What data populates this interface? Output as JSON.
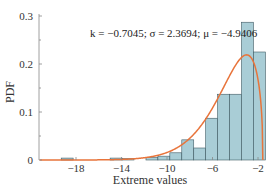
{
  "chart_data": {
    "type": "bar",
    "subtype": "histogram_with_fitted_pdf",
    "title": "",
    "annotation": "k = −0.7045;  σ = 2.3694;  μ = −4.9406",
    "params": {
      "k": -0.7045,
      "sigma": 2.3694,
      "mu": -4.9406
    },
    "xlabel": "Extreme values",
    "ylabel": "PDF",
    "xlim": [
      -21.2,
      -0.9
    ],
    "ylim": [
      0,
      0.3
    ],
    "xticks": [
      -18,
      -14,
      -10,
      -6,
      -2
    ],
    "xtick_labels": [
      "−18",
      "−14",
      "−10",
      "−6",
      "−2"
    ],
    "yticks": [
      0,
      0.1,
      0.2,
      0.3
    ],
    "ytick_labels": [
      "0",
      "0.1",
      "0.2",
      "0.3"
    ],
    "grid": false,
    "legend": null,
    "histogram": {
      "bin_edges": [
        -19.3,
        -18.25,
        -15.0,
        -13.95,
        -12.9,
        -11.85,
        -10.8,
        -9.75,
        -8.7,
        -7.65,
        -6.6,
        -5.55,
        -4.5,
        -3.45,
        -2.4,
        -1.35
      ],
      "bins": [
        {
          "x0": -19.3,
          "x1": -18.25,
          "value": 0.004
        },
        {
          "x0": -15.0,
          "x1": -13.95,
          "value": 0.004
        },
        {
          "x0": -13.95,
          "x1": -12.9,
          "value": 0.003
        },
        {
          "x0": -11.85,
          "x1": -10.8,
          "value": 0.005
        },
        {
          "x0": -10.8,
          "x1": -9.75,
          "value": 0.008
        },
        {
          "x0": -9.75,
          "x1": -8.7,
          "value": 0.015
        },
        {
          "x0": -8.7,
          "x1": -7.65,
          "value": 0.042
        },
        {
          "x0": -7.65,
          "x1": -6.6,
          "value": 0.025
        },
        {
          "x0": -6.6,
          "x1": -5.55,
          "value": 0.087
        },
        {
          "x0": -5.55,
          "x1": -4.5,
          "value": 0.137
        },
        {
          "x0": -4.5,
          "x1": -3.45,
          "value": 0.137
        },
        {
          "x0": -3.45,
          "x1": -2.4,
          "value": 0.287
        },
        {
          "x0": -2.4,
          "x1": -1.35,
          "value": 0.225
        }
      ]
    },
    "series": [
      {
        "name": "GEV fitted PDF",
        "type": "line",
        "color": "#e8743b"
      }
    ],
    "colors": {
      "bar_fill": "#a9cdd6",
      "bar_stroke": "#3f5a63",
      "curve": "#e8743b",
      "axis": "#888888",
      "text": "#333333"
    }
  }
}
